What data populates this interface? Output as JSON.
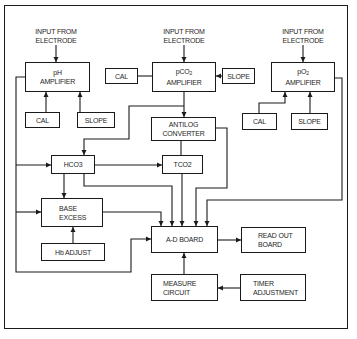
{
  "diagram": {
    "colors": {
      "line": "#1a1a1a",
      "background": "#ffffff",
      "text": "#1f1f1f"
    },
    "inputs": {
      "ph": {
        "line1": "INPUT FROM",
        "line2": "ELECTRODE"
      },
      "pco2": {
        "line1": "INPUT FROM",
        "line2": "ELECTRODE"
      },
      "po2": {
        "line1": "INPUT FROM",
        "line2": "ELECTRODE"
      }
    },
    "boxes": {
      "ph_amp": {
        "line1": "pH",
        "line2": "AMPLIFIER"
      },
      "ph_cal": {
        "label": "CAL"
      },
      "ph_slope": {
        "label": "SLOPE"
      },
      "pco2_cal": {
        "label": "CAL"
      },
      "pco2_amp": {
        "line1_main": "pCO",
        "line1_sub": "2",
        "line2": "AMPLIFIER"
      },
      "pco2_slope": {
        "label": "SLOPE"
      },
      "po2_amp": {
        "line1_main": "pO",
        "line1_sub": "2",
        "line2": "AMPLIFIER"
      },
      "po2_cal": {
        "label": "CAL"
      },
      "po2_slope": {
        "label": "SLOPE"
      },
      "antilog": {
        "line1": "ANTILOG",
        "line2": "CONVERTER"
      },
      "hco3": {
        "label": "HCO3"
      },
      "tco2": {
        "label": "TCO2"
      },
      "base_excess": {
        "line1": "BASE",
        "line2": "EXCESS"
      },
      "hb_adjust": {
        "label": "Hb ADJUST"
      },
      "ad_board": {
        "label": "A-D BOARD"
      },
      "readout": {
        "line1": "READ OUT",
        "line2": "BOARD"
      },
      "measure": {
        "line1": "MEASURE",
        "line2": "CIRCUIT"
      },
      "timer": {
        "line1": "TIMER",
        "line2": "ADJUSTMENT"
      }
    }
  }
}
